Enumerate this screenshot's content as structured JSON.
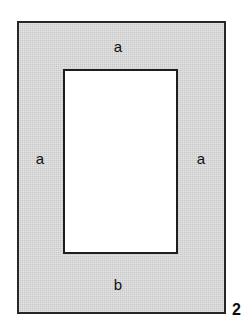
{
  "figure": {
    "number": "2",
    "type": "geometry-diagram",
    "background_color": "#ffffff"
  },
  "outer_rectangle": {
    "name": "outer-rectangle",
    "fill_color": "#c9c9c9",
    "stroke_color": "#262626",
    "x": 17,
    "y": 21,
    "width": 209,
    "height": 293
  },
  "inner_rectangle": {
    "name": "inner-rectangle",
    "fill_color": "#ffffff",
    "stroke_color": "#1e1e1e",
    "x": 63,
    "y": 69,
    "width": 115,
    "height": 185
  },
  "labels": {
    "top": "a",
    "left": "a",
    "right": "a",
    "bottom": "b"
  }
}
